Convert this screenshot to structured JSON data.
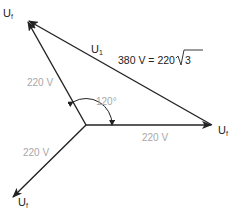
{
  "diagram": {
    "title": "",
    "colors": {
      "line": "#222222",
      "gray_label": "#a8a8a8"
    },
    "labels": {
      "tip_top_left": {
        "main": "U",
        "sub": "f"
      },
      "tip_right": {
        "main": "U",
        "sub": "f"
      },
      "tip_bottom_left": {
        "main": "U",
        "sub": "f"
      },
      "line_voltage_symbol": {
        "main": "U",
        "sub": "1"
      },
      "line_voltage_value": "380 V = 220",
      "sqrt_radicand": "3",
      "phase_voltage_upper": "220 V",
      "phase_voltage_right": "220 V",
      "phase_voltage_lower": "220 V",
      "angle": "120°"
    },
    "vectors": [
      {
        "name": "phase-up-left",
        "from": [
          86,
          125
        ],
        "to": [
          27,
          20
        ]
      },
      {
        "name": "phase-right",
        "from": [
          86,
          125
        ],
        "to": [
          212,
          125
        ]
      },
      {
        "name": "phase-down-left",
        "from": [
          86,
          125
        ],
        "to": [
          12,
          198
        ]
      },
      {
        "name": "line-voltage",
        "from": [
          212,
          125
        ],
        "to": [
          27,
          20
        ]
      }
    ]
  }
}
